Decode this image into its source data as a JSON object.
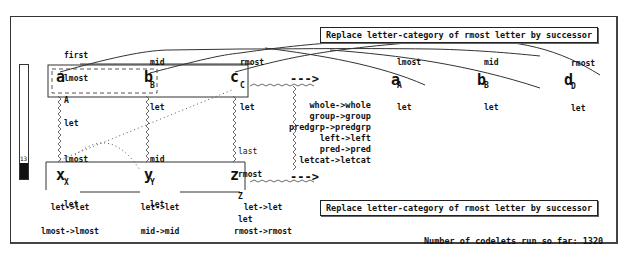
{
  "workspace": {
    "rule_top": "Replace letter-category of rmost letter by successor",
    "rule_bottom": "Replace letter-category of rmost letter by successor",
    "codelets_label": "Number of codelets run so far: 1320",
    "temperature": {
      "value": "13",
      "fill_percent": 14
    },
    "initial_string": {
      "letters": [
        "a",
        "b",
        "c"
      ],
      "descriptors": [
        [
          "first",
          "lmost",
          "A",
          "let"
        ],
        [
          "mid",
          "B",
          "let"
        ],
        [
          "rmost",
          "C",
          "let"
        ]
      ]
    },
    "modified_string": {
      "letters": [
        "a",
        "b",
        "d"
      ],
      "descriptors": [
        [
          "lmost",
          "A",
          "let"
        ],
        [
          "mid",
          "B",
          "let"
        ],
        [
          "rmost",
          "D",
          "let"
        ]
      ]
    },
    "target_string": {
      "letters": [
        "x",
        "y",
        "z"
      ],
      "descriptors": [
        [
          "lmost",
          "X",
          "let"
        ],
        [
          "mid",
          "Y",
          "let"
        ],
        [
          "last",
          "rmost",
          "Z",
          "let"
        ]
      ]
    },
    "bridge_labels": [
      [
        "let->let",
        "lmost->lmost"
      ],
      [
        "let->let",
        "mid->mid"
      ],
      [
        "let->let",
        "rmost->rmost"
      ]
    ],
    "group_mappings": [
      "whole->whole",
      "group->group",
      "predgrp->predgrp",
      "left->left",
      "pred->pred",
      "letcat->letcat"
    ],
    "arrow_top": "--->",
    "arrow_bottom": "--->"
  }
}
